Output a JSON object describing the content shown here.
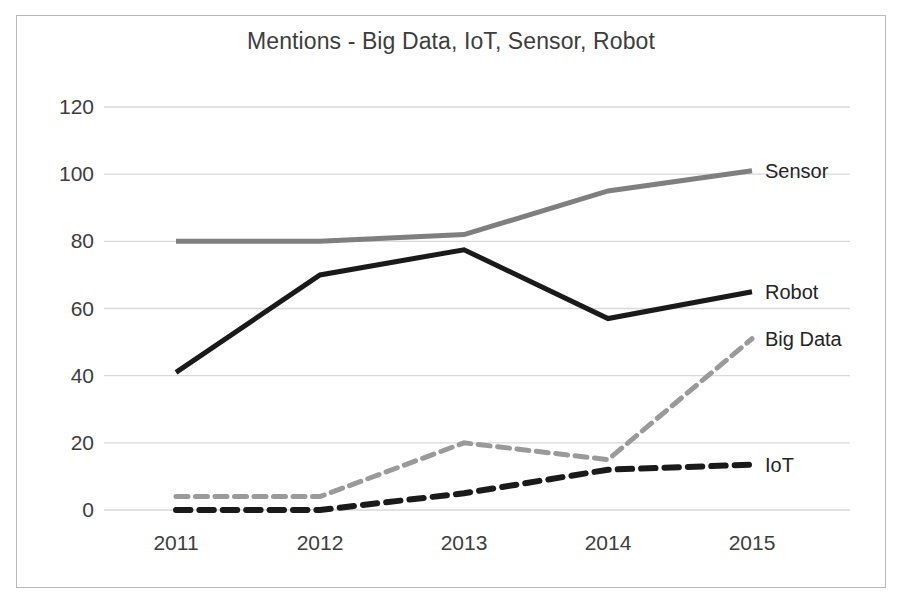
{
  "chart_data": {
    "type": "line",
    "title": "Mentions - Big Data, IoT, Sensor, Robot",
    "xlabel": "",
    "ylabel": "",
    "categories": [
      "2011",
      "2012",
      "2013",
      "2014",
      "2015"
    ],
    "x": [
      2011,
      2012,
      2013,
      2014,
      2015
    ],
    "ylim": [
      0,
      120
    ],
    "yticks": [
      0,
      20,
      40,
      60,
      80,
      100,
      120
    ],
    "ytick_labels": [
      "0",
      "20",
      "40",
      "60",
      "80",
      "100",
      "120"
    ],
    "grid": "horizontal",
    "legend_position": "right-inline-end-of-line",
    "series": [
      {
        "name": "Sensor",
        "values": [
          80,
          80,
          82,
          95,
          101
        ],
        "color": "#7f7f7f",
        "style": "solid",
        "width": 5,
        "label_y_value": 101
      },
      {
        "name": "Robot",
        "values": [
          41,
          70,
          77.5,
          57,
          65
        ],
        "color": "#1a1a1a",
        "style": "solid",
        "width": 5,
        "label_y_value": 65
      },
      {
        "name": "Big Data",
        "values": [
          4,
          4,
          20,
          15,
          51
        ],
        "color": "#9a9a9a",
        "style": "dashed",
        "width": 5,
        "label_y_value": 51
      },
      {
        "name": "IoT",
        "values": [
          0,
          0,
          5,
          12,
          13.5
        ],
        "color": "#1a1a1a",
        "style": "dashed",
        "width": 6,
        "label_y_value": 13.5
      }
    ],
    "colors": {
      "gridline": "#d9d9d9",
      "axis_text": "#3d3d3d",
      "title_text": "#3d3d3d",
      "frame_border": "#b9b9b9",
      "background": "#ffffff"
    }
  }
}
